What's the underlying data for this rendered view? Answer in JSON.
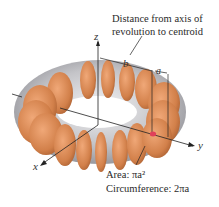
{
  "diagram": {
    "type": "torus-pappus-theorem",
    "annotation_top": {
      "line1": "Distance from axis of",
      "line2": "revolution to centroid"
    },
    "annotation_bottom": {
      "area_label": "Area: πa²",
      "circumference_label": "Circumference: 2πa"
    },
    "axes": {
      "x": "x",
      "y": "y",
      "z": "z"
    },
    "dimensions": {
      "major_radius": "b",
      "minor_radius": "a"
    },
    "colors": {
      "torus_body": "#b8b8bc",
      "disc_fill": "#d98a55",
      "centroid_marker": "#e0405a",
      "lines": "#222222"
    }
  }
}
